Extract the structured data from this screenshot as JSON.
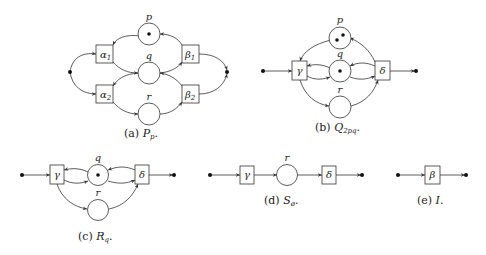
{
  "figure": {
    "panels": [
      {
        "id": "a",
        "caption_prefix": "(a)",
        "caption_name": "P",
        "caption_sub": "p",
        "caption_suffix": ".",
        "places": [
          {
            "name": "p",
            "tokens": 1
          },
          {
            "name": "q",
            "tokens": 0
          },
          {
            "name": "r",
            "tokens": 0
          }
        ],
        "transitions": [
          {
            "name": "α",
            "sub": "1"
          },
          {
            "name": "α",
            "sub": "2"
          },
          {
            "name": "β",
            "sub": "1"
          },
          {
            "name": "β",
            "sub": "2"
          }
        ]
      },
      {
        "id": "b",
        "caption_prefix": "(b)",
        "caption_name": "Q",
        "caption_sub": "2pq",
        "caption_suffix": ".",
        "places": [
          {
            "name": "p",
            "tokens": 2
          },
          {
            "name": "q",
            "tokens": 1
          },
          {
            "name": "r",
            "tokens": 0
          }
        ],
        "transitions": [
          {
            "name": "γ"
          },
          {
            "name": "δ"
          }
        ]
      },
      {
        "id": "c",
        "caption_prefix": "(c)",
        "caption_name": "R",
        "caption_sub": "q",
        "caption_suffix": ".",
        "places": [
          {
            "name": "q",
            "tokens": 1
          },
          {
            "name": "r",
            "tokens": 0
          }
        ],
        "transitions": [
          {
            "name": "γ"
          },
          {
            "name": "δ"
          }
        ]
      },
      {
        "id": "d",
        "caption_prefix": "(d)",
        "caption_name": "S",
        "caption_sub": "ø",
        "caption_suffix": ".",
        "places": [
          {
            "name": "r",
            "tokens": 0
          }
        ],
        "transitions": [
          {
            "name": "γ"
          },
          {
            "name": "δ"
          }
        ]
      },
      {
        "id": "e",
        "caption_prefix": "(e)",
        "caption_name": "I",
        "caption_sub": "",
        "caption_suffix": ".",
        "places": [],
        "transitions": [
          {
            "name": "β"
          }
        ]
      }
    ]
  }
}
